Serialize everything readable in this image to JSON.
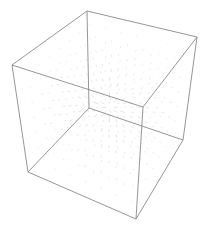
{
  "figure": {
    "type": "3d-vector-field-plot",
    "background": "#ffffff",
    "box_color": "#8a8a8a",
    "arrow_color": "#c4c4c4",
    "box_corners": {
      "top_back": [
        87,
        11
      ],
      "top_left": [
        12,
        65
      ],
      "top_right": [
        197,
        37
      ],
      "top_front": [
        143,
        107
      ],
      "bottom_back": [
        89,
        108
      ],
      "bottom_left": [
        28,
        172
      ],
      "bottom_right": [
        183,
        140
      ],
      "bottom_front": [
        136,
        219
      ]
    },
    "center": [
      110,
      110
    ]
  }
}
